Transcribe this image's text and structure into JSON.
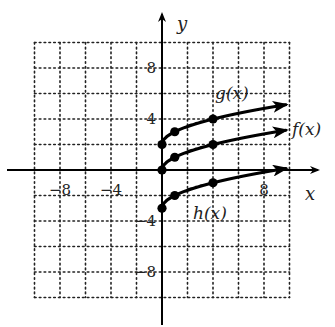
{
  "chart_data": {
    "type": "line",
    "title": "",
    "xlabel": "x",
    "ylabel": "y",
    "xlim": [
      -10,
      10
    ],
    "ylim": [
      -10,
      10
    ],
    "grid": true,
    "grid_step": 2,
    "x_ticks": [
      {
        "value": -8,
        "label": "−8"
      },
      {
        "value": -4,
        "label": "−4"
      },
      {
        "value": 8,
        "label": "8"
      }
    ],
    "y_ticks": [
      {
        "value": 8,
        "label": "8"
      },
      {
        "value": 4,
        "label": "4"
      },
      {
        "value": -4,
        "label": "−4"
      },
      {
        "value": -8,
        "label": "−8"
      }
    ],
    "series": [
      {
        "name": "g(x)",
        "label": "g(x)",
        "expression": "sqrt(x) + 2",
        "x_end": 9.7,
        "points": [
          [
            0,
            2
          ],
          [
            1,
            3
          ],
          [
            4,
            4
          ]
        ]
      },
      {
        "name": "f(x)",
        "label": "f(x)",
        "expression": "sqrt(x)",
        "x_end": 9.7,
        "points": [
          [
            0,
            0
          ],
          [
            1,
            1
          ],
          [
            4,
            2
          ]
        ]
      },
      {
        "name": "h(x)",
        "label": "h(x)",
        "expression": "sqrt(x) - 3",
        "x_end": 9.7,
        "points": [
          [
            0,
            -3
          ],
          [
            1,
            -2
          ],
          [
            4,
            -1
          ]
        ]
      }
    ]
  }
}
